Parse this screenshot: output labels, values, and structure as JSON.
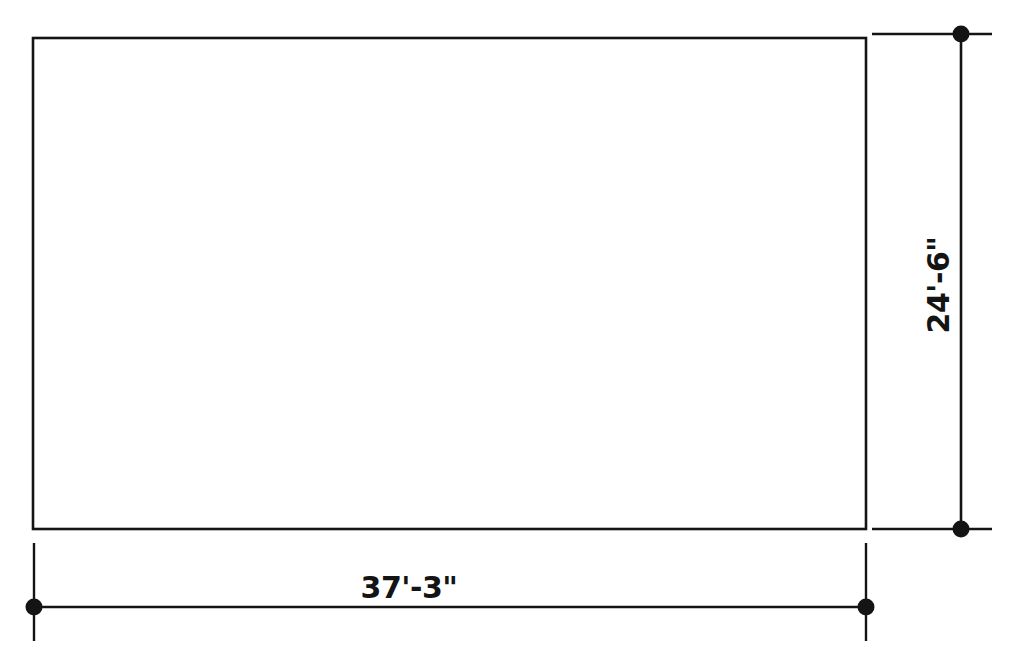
{
  "drawing": {
    "title": "Rectangular floor plan outline with overall dimensions",
    "units": "feet-inches",
    "line_color": "#141414",
    "background_color": "#ffffff",
    "shape": {
      "name": "rectangle",
      "type": "rectangle",
      "width_label": "37'-3\"",
      "height_label": "24'-6\"",
      "width_feet": 37.25,
      "height_feet": 24.5,
      "x": 33,
      "y": 38,
      "w": 833,
      "h": 491
    },
    "dimensions": [
      {
        "id": "horizontal-overall",
        "orientation": "horizontal",
        "label": "37'-3\"",
        "feet": 37,
        "inches": 3,
        "decimal_feet": 37.25,
        "terminator": "dot",
        "line_y": 607,
        "start_x": 34,
        "end_x": 866,
        "text_x": 409,
        "text_y": 598
      },
      {
        "id": "vertical-overall",
        "orientation": "vertical",
        "label": "24'-6\"",
        "feet": 24,
        "inches": 6,
        "decimal_feet": 24.5,
        "terminator": "dot",
        "line_x": 961,
        "start_y": 34,
        "end_y": 529,
        "text_x": 949,
        "text_y": 285,
        "rotation_deg": -90
      }
    ],
    "extension_lines": [
      {
        "id": "top-right-extension",
        "orientation": "horizontal",
        "y": 34,
        "x1": 872,
        "x2": 992
      },
      {
        "id": "bottom-right-extension",
        "orientation": "horizontal",
        "y": 529,
        "x1": 872,
        "x2": 992
      },
      {
        "id": "bottom-left-extension",
        "orientation": "vertical",
        "x": 34,
        "y1": 543,
        "y2": 641
      },
      {
        "id": "bottom-right-vertical-extension",
        "orientation": "vertical",
        "x": 866,
        "y1": 543,
        "y2": 641
      }
    ],
    "terminator_dots": [
      {
        "id": "dot-vertical-top",
        "cx": 961,
        "cy": 34,
        "r": 8
      },
      {
        "id": "dot-vertical-bottom",
        "cx": 961,
        "cy": 529,
        "r": 8
      },
      {
        "id": "dot-horizontal-left",
        "cx": 34,
        "cy": 607,
        "r": 8
      },
      {
        "id": "dot-horizontal-right",
        "cx": 866,
        "cy": 607,
        "r": 8
      }
    ]
  }
}
